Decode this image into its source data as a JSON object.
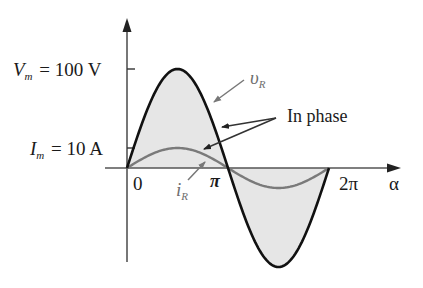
{
  "diagram": {
    "colors": {
      "voltage_curve": "#111111",
      "current_curve": "#7a7a7a",
      "fill": "#e6e6e6",
      "axes": "#555555",
      "text": "#1a1a1a",
      "gray_text": "#6e6e6e"
    },
    "labels": {
      "vm_symbol": "V",
      "vm_sub": "m",
      "vm_value": "= 100 V",
      "im_symbol": "I",
      "im_sub": "m",
      "im_value": "= 10 A",
      "origin": "0",
      "pi": "π",
      "two_pi": "2π",
      "x_axis": "α",
      "vr_symbol": "υ",
      "vr_sub": "R",
      "ir_symbol": "i",
      "ir_sub": "R",
      "annotation": "In phase"
    }
  },
  "chart_data": {
    "type": "line",
    "title": "",
    "xlabel": "α",
    "ylabel": "",
    "x_ticks": [
      "0",
      "π",
      "2π"
    ],
    "series": [
      {
        "name": "υR",
        "amplitude": 100,
        "unit": "V",
        "function": "100 sin(α)",
        "x": [
          0,
          0.5,
          1,
          1.5,
          2
        ],
        "x_unit": "π",
        "values": [
          0,
          100,
          0,
          -100,
          0
        ]
      },
      {
        "name": "iR",
        "amplitude": 10,
        "unit": "A",
        "function": "10 sin(α)",
        "x": [
          0,
          0.5,
          1,
          1.5,
          2
        ],
        "x_unit": "π",
        "values": [
          0,
          10,
          0,
          -10,
          0
        ]
      }
    ],
    "annotations": [
      "Vm = 100 V",
      "Im = 10 A",
      "In phase"
    ]
  }
}
